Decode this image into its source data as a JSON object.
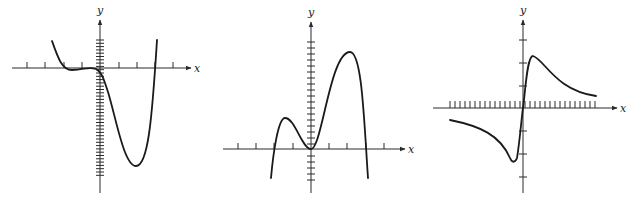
{
  "graphs": [
    {
      "id": "graph-1",
      "x_label": "x",
      "y_label": "y",
      "origin": [
        100,
        68
      ],
      "x_axis": {
        "from": 12,
        "to": 191
      },
      "y_axis": {
        "from": 20,
        "to": 193
      },
      "x_ticks": [
        27,
        45,
        64,
        82,
        119,
        137,
        155,
        173
      ],
      "x_tick_side": "up",
      "y_ticks": {
        "from": 40,
        "to": 178,
        "step": 3.3
      },
      "curve": "M52,41 C58,58 62,70 72,70 C84,70 88,66 96,69 C102,72 104,80 108,92 C116,118 124,166 136,166 C148,166 152,120 157,40",
      "color": "#1a1a1a"
    },
    {
      "id": "graph-2",
      "x_label": "x",
      "y_label": "y",
      "origin": [
        311,
        149
      ],
      "x_axis": {
        "from": 223,
        "to": 405
      },
      "y_axis": {
        "from": 22,
        "to": 193
      },
      "x_ticks": [
        238,
        256,
        274,
        293,
        329,
        347,
        366,
        384
      ],
      "x_tick_side": "up",
      "y_ticks": {
        "from": 42,
        "to": 180,
        "step": 6
      },
      "curve": "M271,178 C273,155 278,118 285,118 C295,118 302,149 311,149 C322,149 330,52 350,52 C362,52 364,120 368,178",
      "color": "#1a1a1a"
    },
    {
      "id": "graph-3",
      "x_label": "x",
      "y_label": "y",
      "origin": [
        523,
        108
      ],
      "x_axis": {
        "from": 433,
        "to": 617
      },
      "y_axis": {
        "from": 20,
        "to": 193
      },
      "x_ticks": {
        "from": 450,
        "to": 597,
        "step": 5
      },
      "x_tick_side": "up",
      "y_ticks_list": [
        40,
        63,
        86,
        131,
        154,
        177
      ],
      "curve": "M450,120 C480,126 500,135 510,158 C512,163 515,163 517,158 C520,140 522,112 524,100 C526,80 528,56 533,56 C545,60 555,90 596,96",
      "color": "#1a1a1a"
    }
  ]
}
